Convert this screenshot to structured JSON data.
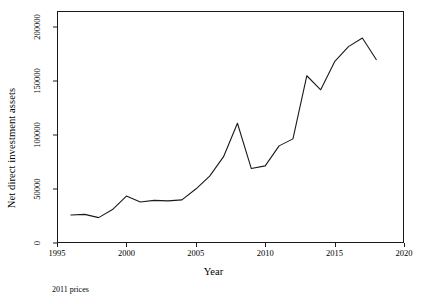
{
  "chart_data": {
    "type": "line",
    "title": "",
    "xlabel": "Year",
    "ylabel": "Net direct investment assets",
    "xlim": [
      1995,
      2020
    ],
    "ylim": [
      0,
      215000
    ],
    "xticks": [
      "1995",
      "2000",
      "2005",
      "2010",
      "2015",
      "2020"
    ],
    "yticks": [
      "0",
      "50000",
      "100000",
      "150000",
      "200000"
    ],
    "grid": false,
    "legend": null,
    "annotation": "2011 prices",
    "series": [
      {
        "name": "Net direct investment assets",
        "x": [
          1996,
          1997,
          1998,
          1999,
          2000,
          2001,
          2002,
          2003,
          2004,
          2005,
          2006,
          2007,
          2008,
          2009,
          2010,
          2011,
          2012,
          2013,
          2014,
          2015,
          2016,
          2017,
          2018
        ],
        "values": [
          26000,
          26500,
          23500,
          31000,
          43500,
          38000,
          39500,
          39000,
          40000,
          50000,
          62000,
          80000,
          111000,
          69000,
          71500,
          90000,
          96500,
          155000,
          142000,
          168000,
          182000,
          190000,
          170000
        ]
      }
    ]
  }
}
